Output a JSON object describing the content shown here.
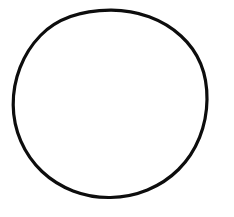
{
  "canvas": {
    "width": 234,
    "height": 217,
    "background_color": "#ffffff",
    "title": "Circle Outline"
  },
  "figure": {
    "name": "circle-outline",
    "shape_type": "circle",
    "stroke_color": "#0d0d0d",
    "fill_color": "none",
    "stroke_width": 3.2,
    "center_x": 110,
    "center_y": 106,
    "radius_x": 97,
    "radius_y": 96,
    "bounds": {
      "left": 13,
      "top": 10,
      "right": 207,
      "bottom": 202
    }
  },
  "labels": {
    "none_visible": ""
  }
}
